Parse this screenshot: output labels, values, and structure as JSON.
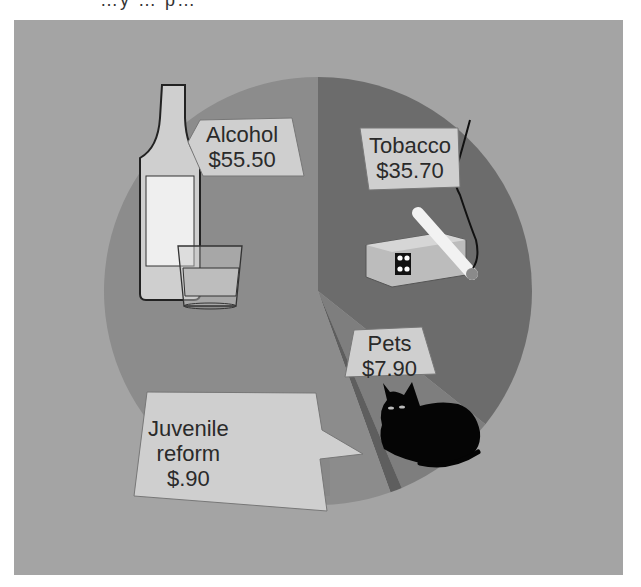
{
  "header": {
    "cut_off_title": "…y … p…"
  },
  "chart_data": {
    "type": "pie",
    "title": "",
    "categories": [
      "Alcohol",
      "Tobacco",
      "Pets",
      "Juvenile reform"
    ],
    "values": [
      55.5,
      35.7,
      7.9,
      0.9
    ],
    "unit": "$",
    "labels": [
      {
        "name": "Alcohol",
        "value": "$55.50",
        "icon": "bottle-and-glass-icon"
      },
      {
        "name": "Tobacco",
        "value": "$35.70",
        "icon": "cigarette-pack-icon"
      },
      {
        "name": "Pets",
        "value": "$7.90",
        "icon": "black-cat-icon"
      },
      {
        "name": "Juvenile reform",
        "value": "$.90",
        "icon": "jail-bars-icon"
      }
    ],
    "start_angle_deg": 0,
    "direction": "clockwise",
    "legend": "none",
    "colors": {
      "alcohol": "#8c8c8c",
      "tobacco": "#6c6c6c",
      "pets": "#7e7e7e",
      "juvenile": "#5e5e5e",
      "background": "#a4a4a4",
      "label_box": "#cfcfcf"
    }
  },
  "labels": {
    "alcohol_name": "Alcohol",
    "alcohol_value": "$55.50",
    "tobacco_name": "Tobacco",
    "tobacco_value": "$35.70",
    "pets_name": "Pets",
    "pets_value": "$7.90",
    "juvenile_line1": "Juvenile",
    "juvenile_line2": "reform",
    "juvenile_value": "$.90"
  }
}
